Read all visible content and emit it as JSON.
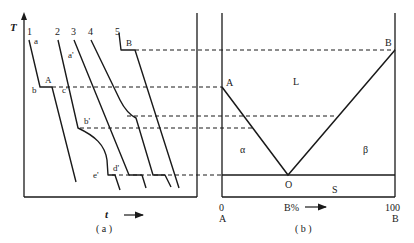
{
  "panel_a": {
    "caption": "( a )",
    "y_axis_label": "T",
    "x_axis_label": "t",
    "curve_labels": [
      "1",
      "2",
      "3",
      "4",
      "5"
    ],
    "point_labels": {
      "a": "a",
      "A": "A",
      "b": "b",
      "c": "c'",
      "a_prime": "a'",
      "b_prime": "b'",
      "d_prime": "d'",
      "e_prime": "e'",
      "B": "B"
    }
  },
  "panel_b": {
    "caption": "( b )",
    "x_axis_label": "B%",
    "x_min_value": "0",
    "x_max_value": "100",
    "x_min_component": "A",
    "x_max_component": "B",
    "point_labels": {
      "A": "A",
      "B": "B",
      "O": "O"
    },
    "region_labels": {
      "liquid": "L",
      "alpha": "α",
      "beta": "β",
      "solid": "S"
    }
  },
  "colors": {
    "line": "#1a1a1a",
    "background": "#ffffff"
  }
}
